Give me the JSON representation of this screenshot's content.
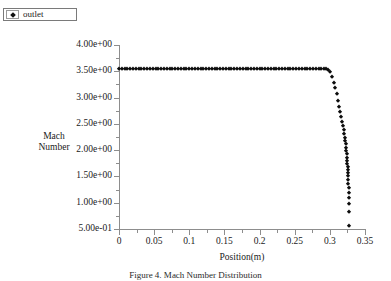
{
  "legend": {
    "marker": "diamond-marker",
    "label": "outlet"
  },
  "caption": {
    "text": "Figure 4.  Mach Number Distribution"
  },
  "chart_data": {
    "type": "scatter",
    "title": "",
    "xlabel": "Position(m)",
    "ylabel": "Mach Number",
    "ylabel_line1": "Mach",
    "ylabel_line2": "Number",
    "series_name": "outlet",
    "marker": "diamond",
    "marker_color": "#0d0d0d",
    "grid": false,
    "legend_position": "top-left-outside",
    "xlim": [
      0,
      0.35
    ],
    "ylim": [
      0.5,
      4.0
    ],
    "xticks": [
      0,
      0.05,
      0.1,
      0.15,
      0.2,
      0.25,
      0.3,
      0.35
    ],
    "xtick_labels": [
      "0",
      "0.05",
      "0.1",
      "0.15",
      "0.2",
      "0.25",
      "0.3",
      "0.35"
    ],
    "yticks": [
      0.5,
      1.0,
      1.5,
      2.0,
      2.5,
      3.0,
      3.5,
      4.0
    ],
    "ytick_labels": [
      "5.00e-01",
      "1.00e+00",
      "1.50e+00",
      "2.00e+00",
      "2.50e+00",
      "3.00e+00",
      "3.50e+00",
      "4.00e+00"
    ],
    "x": [
      0.0,
      0.004,
      0.008,
      0.012,
      0.016,
      0.02,
      0.024,
      0.028,
      0.032,
      0.036,
      0.04,
      0.044,
      0.048,
      0.052,
      0.056,
      0.06,
      0.064,
      0.068,
      0.072,
      0.076,
      0.08,
      0.084,
      0.088,
      0.092,
      0.096,
      0.1,
      0.104,
      0.108,
      0.112,
      0.116,
      0.12,
      0.124,
      0.128,
      0.132,
      0.136,
      0.14,
      0.144,
      0.148,
      0.152,
      0.156,
      0.16,
      0.164,
      0.168,
      0.172,
      0.176,
      0.18,
      0.184,
      0.188,
      0.192,
      0.196,
      0.2,
      0.204,
      0.208,
      0.212,
      0.216,
      0.22,
      0.224,
      0.228,
      0.232,
      0.236,
      0.24,
      0.244,
      0.248,
      0.252,
      0.256,
      0.26,
      0.264,
      0.268,
      0.272,
      0.276,
      0.28,
      0.284,
      0.288,
      0.291,
      0.294,
      0.297,
      0.3,
      0.303,
      0.306,
      0.308,
      0.31,
      0.312,
      0.3135,
      0.315,
      0.3163,
      0.3175,
      0.3185,
      0.3195,
      0.3203,
      0.3211,
      0.3218,
      0.3224,
      0.323,
      0.3235,
      0.324,
      0.3244,
      0.3248,
      0.3251,
      0.3254,
      0.3257,
      0.3259,
      0.3261,
      0.3263,
      0.3264,
      0.3266,
      0.3267,
      0.3268,
      0.3269,
      0.327,
      0.3271
    ],
    "y": [
      3.55,
      3.55,
      3.55,
      3.55,
      3.55,
      3.55,
      3.55,
      3.55,
      3.55,
      3.55,
      3.55,
      3.55,
      3.55,
      3.55,
      3.55,
      3.55,
      3.55,
      3.55,
      3.55,
      3.55,
      3.55,
      3.55,
      3.55,
      3.55,
      3.55,
      3.55,
      3.55,
      3.55,
      3.55,
      3.55,
      3.55,
      3.55,
      3.55,
      3.55,
      3.55,
      3.55,
      3.55,
      3.55,
      3.55,
      3.55,
      3.55,
      3.55,
      3.55,
      3.55,
      3.55,
      3.55,
      3.55,
      3.55,
      3.55,
      3.55,
      3.55,
      3.55,
      3.55,
      3.55,
      3.55,
      3.55,
      3.55,
      3.55,
      3.55,
      3.55,
      3.55,
      3.55,
      3.55,
      3.55,
      3.55,
      3.55,
      3.55,
      3.55,
      3.55,
      3.55,
      3.55,
      3.55,
      3.55,
      3.55,
      3.54,
      3.52,
      3.48,
      3.4,
      3.28,
      3.18,
      3.06,
      2.93,
      2.83,
      2.72,
      2.63,
      2.54,
      2.46,
      2.38,
      2.31,
      2.24,
      2.17,
      2.11,
      2.04,
      1.98,
      1.92,
      1.86,
      1.8,
      1.74,
      1.68,
      1.62,
      1.56,
      1.5,
      1.43,
      1.36,
      1.28,
      1.19,
      1.09,
      0.97,
      0.83,
      0.56
    ]
  }
}
